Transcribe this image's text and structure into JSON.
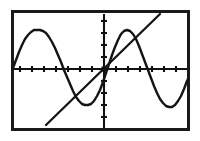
{
  "screen": {
    "device_label": "graphing-calculator-screen",
    "width_px": 200,
    "height_px": 141,
    "background_color": "#ffffff",
    "border_color": "#1a1a1a",
    "ink_color": "#141414"
  },
  "frame": {
    "x": 11,
    "y": 10,
    "width": 179,
    "height": 121,
    "stroke_width": 3
  },
  "plot_area": {
    "left_px": 13,
    "right_px": 188,
    "top_px": 12,
    "bottom_px": 129,
    "origin_x_px": 104,
    "origin_y_px": 69,
    "x_tick_spacing_px": 12,
    "y_tick_spacing_px": 12,
    "tick_half_length_px": 3
  },
  "chart_data": {
    "type": "line",
    "title": "",
    "subtitle": "",
    "xlabel": "",
    "ylabel": "",
    "grid": false,
    "legend_position": "none",
    "axes": {
      "x_axis_shown": true,
      "y_axis_shown": true,
      "x_tick_count": 15,
      "y_tick_count": 10,
      "xlim": [
        -7.583,
        7.0
      ],
      "ylim": [
        -5.0,
        4.75
      ],
      "x_tick_step": 1,
      "y_tick_step": 1,
      "tick_marks_only": true,
      "tick_labels_shown": false
    },
    "series": [
      {
        "name": "sine-curve",
        "kind": "sinusoid",
        "equation": "y = 3.25 sin(x)",
        "amplitude": 3.25,
        "period": 7.0,
        "phase": 0,
        "stroke": "#141414",
        "samples_px": [
          [
            13,
            68
          ],
          [
            16,
            60
          ],
          [
            19,
            52
          ],
          [
            22,
            45
          ],
          [
            25,
            39
          ],
          [
            28,
            35
          ],
          [
            31,
            32
          ],
          [
            34,
            30
          ],
          [
            37,
            30
          ],
          [
            40,
            30
          ],
          [
            43,
            31
          ],
          [
            46,
            33
          ],
          [
            49,
            37
          ],
          [
            52,
            42
          ],
          [
            55,
            48
          ],
          [
            58,
            55
          ],
          [
            61,
            62
          ],
          [
            64,
            70
          ],
          [
            67,
            77
          ],
          [
            70,
            84
          ],
          [
            73,
            91
          ],
          [
            76,
            97
          ],
          [
            79,
            101
          ],
          [
            82,
            104
          ],
          [
            85,
            105
          ],
          [
            88,
            105
          ],
          [
            91,
            104
          ],
          [
            94,
            101
          ],
          [
            97,
            96
          ],
          [
            100,
            90
          ],
          [
            103,
            82
          ],
          [
            106,
            73
          ],
          [
            109,
            64
          ],
          [
            112,
            55
          ],
          [
            115,
            47
          ],
          [
            118,
            40
          ],
          [
            121,
            34
          ],
          [
            124,
            31
          ],
          [
            127,
            30
          ],
          [
            130,
            31
          ],
          [
            133,
            34
          ],
          [
            136,
            39
          ],
          [
            139,
            46
          ],
          [
            142,
            54
          ],
          [
            145,
            62
          ],
          [
            148,
            70
          ],
          [
            151,
            78
          ],
          [
            154,
            86
          ],
          [
            157,
            93
          ],
          [
            160,
            99
          ],
          [
            163,
            103
          ],
          [
            166,
            106
          ],
          [
            169,
            107
          ],
          [
            172,
            107
          ],
          [
            175,
            105
          ],
          [
            178,
            101
          ],
          [
            181,
            96
          ],
          [
            184,
            89
          ],
          [
            187,
            81
          ],
          [
            188,
            79
          ]
        ],
        "key_points": {
          "peaks_px": [
            [
              40,
              30
            ],
            [
              126,
              30
            ]
          ],
          "troughs_px": [
            [
              85,
              105
            ],
            [
              170,
              107
            ]
          ],
          "zero_crossings_px": [
            [
              20,
              69
            ],
            [
              63,
              69
            ],
            [
              104,
              69
            ],
            [
              147,
              69
            ],
            [
              189,
              69
            ]
          ]
        }
      },
      {
        "name": "linear-curve",
        "kind": "line",
        "equation": "y = x",
        "slope": 1,
        "intercept": 0,
        "stroke": "#141414",
        "endpoints_px": [
          [
            46,
            125
          ],
          [
            160,
            14
          ]
        ],
        "passes_through_origin": true
      }
    ],
    "annotations": [
      {
        "name": "origin-marker",
        "type": "point",
        "x_px": 104,
        "y_px": 69,
        "note": "intersection of axes and both curves"
      }
    ],
    "intersections_px": [
      [
        104,
        69
      ],
      [
        63,
        110
      ],
      [
        136,
        36
      ]
    ]
  }
}
